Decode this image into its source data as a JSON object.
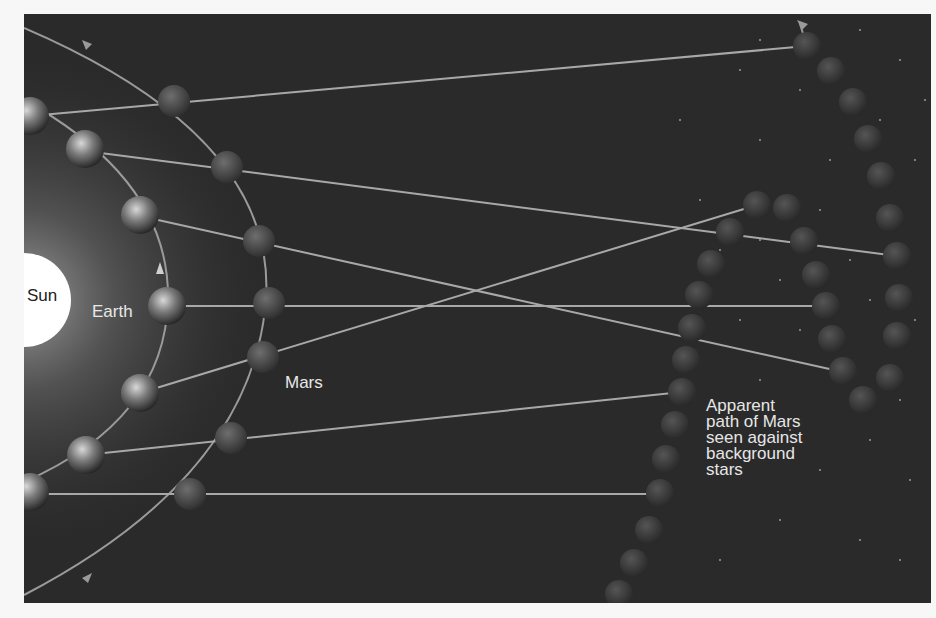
{
  "figure": {
    "colors": {
      "background": "#2a2a2a",
      "sun": "#ffffff",
      "line": "#a8a8a8",
      "label": "#e8e8e8"
    },
    "labels": {
      "sun": "Sun",
      "earth": "Earth",
      "mars": "Mars",
      "apparent_path": [
        "Apparent",
        "path of Mars",
        "seen against",
        "background",
        "stars"
      ]
    },
    "icons": {
      "sun": "sun-disk",
      "earth": "earth-globe",
      "mars": "mars-sphere",
      "orbit_arrow": "arrowhead"
    }
  }
}
